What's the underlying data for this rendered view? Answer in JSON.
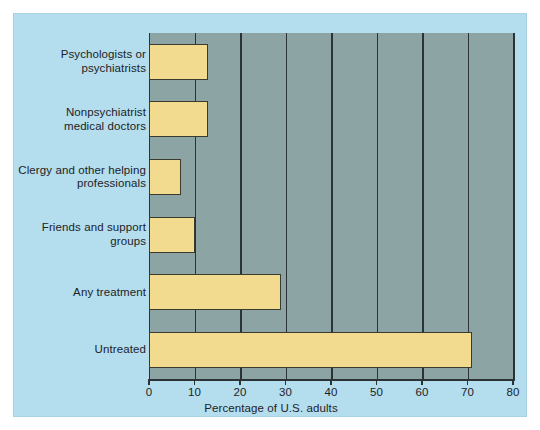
{
  "chart_data": {
    "type": "bar",
    "orientation": "horizontal",
    "title": "",
    "xlabel": "Percentage of U.S. adults",
    "ylabel": "",
    "categories": [
      "Psychologists or psychiatrists",
      "Nonpsychiatrist medical doctors",
      "Clergy and other helping professionals",
      "Friends and support groups",
      "Any treatment",
      "Untreated"
    ],
    "category_lines": [
      [
        "Psychologists or",
        "psychiatrists"
      ],
      [
        "Nonpsychiatrist",
        "medical doctors"
      ],
      [
        "Clergy and other helping",
        "professionals"
      ],
      [
        "Friends and support",
        "groups"
      ],
      [
        "Any treatment"
      ],
      [
        "Untreated"
      ]
    ],
    "values": [
      13,
      13,
      7,
      10,
      29,
      71
    ],
    "xlim": [
      0,
      80
    ],
    "xticks": [
      0,
      10,
      20,
      30,
      40,
      50,
      60,
      70,
      80
    ],
    "xtick_labels": [
      "0",
      "10",
      "20",
      "30",
      "40",
      "50",
      "60",
      "70",
      "80"
    ],
    "grid": "vertical",
    "legend": "none"
  },
  "colors": {
    "figure_background": "#b4ddee",
    "plot_background": "#8ca4a4",
    "bar_fill": "#f2da8e",
    "bar_outline": "#393a30",
    "axis": "#2c3336",
    "text": "#1d2326"
  }
}
